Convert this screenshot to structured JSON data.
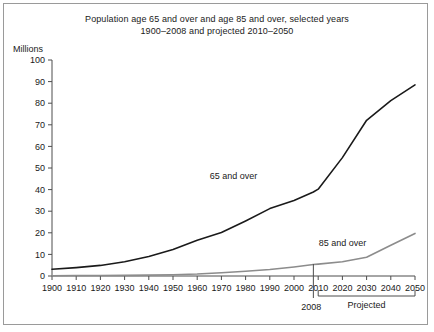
{
  "figure": {
    "title_line1": "Population age 65 and over and age 85 and over, selected years",
    "title_line2": "1900–2008 and projected 2010–2050",
    "unit_label": "Millions"
  },
  "annotations": {
    "marker_2008": "2008",
    "projected_bracket": "Projected"
  },
  "colors": {
    "series_65": "#1a1a1a",
    "series_85": "#8c8c8c",
    "axis": "#4d4d4d",
    "frame": "#9a9a9a",
    "background": "#ffffff"
  },
  "chart_data": {
    "type": "line",
    "title": "Population age 65 and over and age 85 and over, selected years 1900–2008 and projected 2010–2050",
    "xlabel": "",
    "ylabel": "Millions",
    "xlim": [
      1900,
      2050
    ],
    "ylim": [
      0,
      100
    ],
    "ytick_step": 10,
    "grid": false,
    "legend_position": "inline-labels",
    "x": [
      1900,
      1910,
      1920,
      1930,
      1940,
      1950,
      1960,
      1970,
      1980,
      1990,
      2000,
      2008,
      2010,
      2020,
      2030,
      2040,
      2050
    ],
    "xticks": [
      1900,
      1910,
      1920,
      1930,
      1940,
      1950,
      1960,
      1970,
      1980,
      1990,
      2000,
      2010,
      2020,
      2030,
      2040,
      2050
    ],
    "xticklabels": [
      "1900",
      "1910",
      "1920",
      "1930",
      "1940",
      "1950",
      "1960",
      "1970",
      "1980",
      "1990",
      "2000",
      "2010",
      "2020",
      "2030",
      "2040",
      "2050"
    ],
    "yticks": [
      0,
      10,
      20,
      30,
      40,
      50,
      60,
      70,
      80,
      90,
      100
    ],
    "yticklabels": [
      "0",
      "10",
      "20",
      "30",
      "40",
      "50",
      "60",
      "70",
      "80",
      "90",
      "100"
    ],
    "series": [
      {
        "name": "65 and over",
        "color": "#1a1a1a",
        "values": [
          3.1,
          3.9,
          4.9,
          6.6,
          9.0,
          12.3,
          16.6,
          20.1,
          25.5,
          31.2,
          35.0,
          38.9,
          40.2,
          54.8,
          72.1,
          81.2,
          88.5
        ]
      },
      {
        "name": "85 and over",
        "color": "#8c8c8c",
        "values": [
          0.1,
          0.2,
          0.2,
          0.3,
          0.4,
          0.6,
          0.9,
          1.5,
          2.2,
          3.0,
          4.2,
          5.3,
          5.5,
          6.6,
          8.7,
          14.2,
          19.7
        ]
      }
    ],
    "series_label_positions": [
      {
        "name": "65 and over",
        "x": 1975,
        "y": 45
      },
      {
        "name": "85 and over",
        "x": 2020,
        "y": 14
      }
    ],
    "projection_start_year": 2010,
    "observed_end_year": 2008
  }
}
